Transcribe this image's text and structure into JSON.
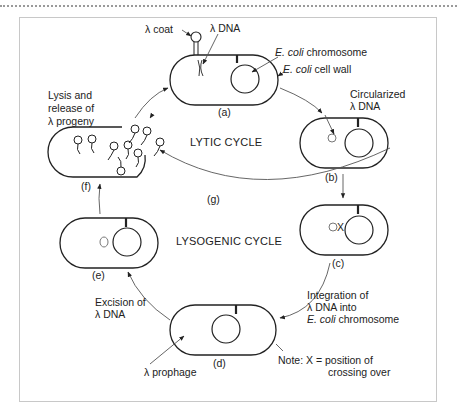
{
  "diagram": {
    "title_labels": {
      "lytic_cycle": "LYTIC CYCLE",
      "lysogenic_cycle": "LYSOGENIC CYCLE"
    },
    "stages": [
      {
        "id": "a",
        "label": "(a)"
      },
      {
        "id": "b",
        "label": "(b)"
      },
      {
        "id": "c",
        "label": "(c)"
      },
      {
        "id": "d",
        "label": "(d)"
      },
      {
        "id": "e",
        "label": "(e)"
      },
      {
        "id": "f",
        "label": "(f)"
      },
      {
        "id": "g",
        "label": "(g)"
      }
    ],
    "annotations": {
      "lambda_coat": "λ coat",
      "lambda_dna": "λ DNA",
      "ecoli_chromosome_italic": "E. coli",
      "ecoli_chromosome_rest": " chromosome",
      "ecoli_wall_italic": "E. coli",
      "ecoli_wall_rest": " cell wall",
      "circularized_line1": "Circularized",
      "circularized_line2": "λ DNA",
      "lysis_line1": "Lysis and",
      "lysis_line2": "release of",
      "lysis_line3": "λ progeny",
      "integration_line1": "Integration of",
      "integration_line2": "λ DNA into",
      "integration_line3_italic": "E. coli",
      "integration_line3_rest": " chromosome",
      "excision_line1": "Excision of",
      "excision_line2": "λ DNA",
      "prophage": "λ prophage",
      "note_line1": "Note: X = position of",
      "note_line2": "crossing over",
      "crossover_mark": "X"
    }
  }
}
